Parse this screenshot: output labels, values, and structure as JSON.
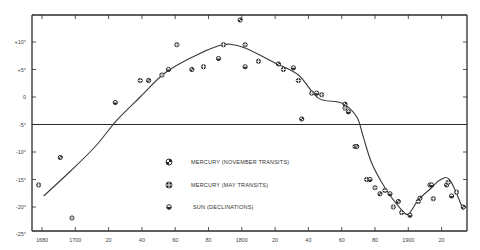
{
  "chart_data": {
    "type": "scatter",
    "title": "",
    "xlabel": "",
    "ylabel": "",
    "xlim": [
      1674,
      1936
    ],
    "ylim": [
      -25,
      15
    ],
    "grid": false,
    "x_ticks": [
      1680,
      1700,
      1720,
      1740,
      1760,
      1780,
      1800,
      1820,
      1840,
      1860,
      1880,
      1900,
      1920
    ],
    "x_tick_labels": [
      "1680",
      "1700",
      "20",
      "40",
      "60",
      "80",
      "1800",
      "20",
      "40",
      "60",
      "80",
      "1900",
      "20"
    ],
    "y_ticks": [
      10,
      5,
      0,
      -5,
      -10,
      -15,
      -20,
      -25
    ],
    "y_tick_labels": [
      "+10°",
      "+5°",
      "0",
      "-5°",
      "-10°",
      "-15°",
      "-20°",
      "-25°"
    ],
    "reference_line": {
      "y": -5
    },
    "legend": {
      "position": "center",
      "entries": [
        {
          "name": "MERCURY (NOVEMBER TRANSITS)",
          "marker": "quartered-circle"
        },
        {
          "name": "MERCURY (MAY TRANSITS)",
          "marker": "crossed-circle"
        },
        {
          "name": "SUN (DECLINATIONS)",
          "marker": "half-filled-circle"
        }
      ]
    },
    "series": [
      {
        "name": "Observations",
        "type": "scatter",
        "points": [
          [
            1678,
            -16
          ],
          [
            1691,
            -11
          ],
          [
            1698,
            -22
          ],
          [
            1724,
            -1
          ],
          [
            1739,
            3
          ],
          [
            1744,
            3
          ],
          [
            1752,
            4
          ],
          [
            1756,
            5
          ],
          [
            1761,
            9.5
          ],
          [
            1770,
            5
          ],
          [
            1777,
            5.5
          ],
          [
            1786,
            7
          ],
          [
            1789,
            9.5
          ],
          [
            1799,
            14
          ],
          [
            1802,
            9.5
          ],
          [
            1802,
            5.5
          ],
          [
            1810,
            6.5
          ],
          [
            1822,
            6
          ],
          [
            1825,
            5
          ],
          [
            1831,
            5.3
          ],
          [
            1834,
            3
          ],
          [
            1836,
            -4
          ],
          [
            1842,
            0.7
          ],
          [
            1845,
            0.7
          ],
          [
            1848,
            0.4
          ],
          [
            1862,
            -1.3
          ],
          [
            1862,
            -2
          ],
          [
            1864,
            -2.7
          ],
          [
            1868,
            -9
          ],
          [
            1869,
            -9
          ],
          [
            1875,
            -15
          ],
          [
            1877,
            -15
          ],
          [
            1880,
            -16.5
          ],
          [
            1883,
            -17.6
          ],
          [
            1886,
            -17
          ],
          [
            1889,
            -17.6
          ],
          [
            1891,
            -20
          ],
          [
            1894,
            -19
          ],
          [
            1896,
            -21
          ],
          [
            1901,
            -21.5
          ],
          [
            1906,
            -19
          ],
          [
            1907,
            -18.4
          ],
          [
            1913,
            -16
          ],
          [
            1914,
            -16
          ],
          [
            1915,
            -18.5
          ],
          [
            1923,
            -16
          ],
          [
            1924,
            -15.5
          ],
          [
            1926,
            -18
          ],
          [
            1929,
            -17.3
          ],
          [
            1933,
            -20
          ]
        ]
      },
      {
        "name": "Smoothed curve",
        "type": "line",
        "points": [
          [
            1681,
            -18
          ],
          [
            1697,
            -13.5
          ],
          [
            1712,
            -9
          ],
          [
            1725,
            -4.2
          ],
          [
            1739,
            0
          ],
          [
            1754,
            4.4
          ],
          [
            1772,
            7.5
          ],
          [
            1786,
            9.3
          ],
          [
            1793,
            9.6
          ],
          [
            1802,
            8.9
          ],
          [
            1820,
            6.2
          ],
          [
            1834,
            4
          ],
          [
            1846,
            -0.2
          ],
          [
            1860,
            -1.1
          ],
          [
            1869,
            -3.6
          ],
          [
            1873,
            -7.3
          ],
          [
            1878,
            -12
          ],
          [
            1886,
            -16.5
          ],
          [
            1895,
            -20.2
          ],
          [
            1900,
            -21.3
          ],
          [
            1906,
            -18.7
          ],
          [
            1914,
            -16.5
          ],
          [
            1919,
            -15.1
          ],
          [
            1925,
            -15.1
          ],
          [
            1933,
            -20.5
          ]
        ]
      }
    ]
  },
  "layout": {
    "frame": {
      "left": 32,
      "top": 15,
      "right": 467,
      "bottom": 231
    },
    "x_origin_px": 42,
    "x_px_per_year": 1.665,
    "y_zero_px": 97,
    "y_px_per_degree": 5.5,
    "ink_color": "#2a2a2a"
  }
}
